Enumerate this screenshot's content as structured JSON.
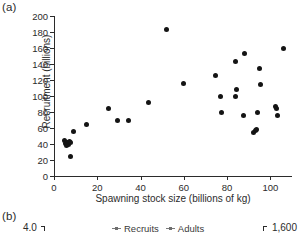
{
  "figure": {
    "panel_a_label": "(a)",
    "panel_b_label": "(b)"
  },
  "chart_data": {
    "type": "scatter",
    "title": "",
    "xlabel": "Spawning stock size (billions of kg)",
    "ylabel": "Recruitment (billions)",
    "xlim": [
      0,
      110
    ],
    "ylim": [
      0,
      200
    ],
    "xticks": [
      0,
      20,
      40,
      60,
      80,
      100
    ],
    "xtick_labels": [
      "0",
      "20",
      "40",
      "60",
      "80",
      "100"
    ],
    "yticks": [
      0,
      20,
      40,
      60,
      80,
      100,
      120,
      140,
      160,
      180,
      200
    ],
    "ytick_labels": [
      "0",
      "20",
      "40",
      "60",
      "80",
      "100",
      "120",
      "140",
      "160",
      "180",
      "200"
    ],
    "grid": false,
    "legend": null,
    "marker": "filled-circle",
    "marker_color": "#141414",
    "points": [
      {
        "x": 5.0,
        "y": 44
      },
      {
        "x": 5.5,
        "y": 41
      },
      {
        "x": 5.8,
        "y": 38
      },
      {
        "x": 6.3,
        "y": 42
      },
      {
        "x": 6.6,
        "y": 39
      },
      {
        "x": 7.2,
        "y": 43
      },
      {
        "x": 7.6,
        "y": 42
      },
      {
        "x": 7.8,
        "y": 24
      },
      {
        "x": 9.0,
        "y": 56
      },
      {
        "x": 15.0,
        "y": 65
      },
      {
        "x": 25.0,
        "y": 84
      },
      {
        "x": 29.5,
        "y": 70
      },
      {
        "x": 34.5,
        "y": 70
      },
      {
        "x": 43.5,
        "y": 92
      },
      {
        "x": 52.0,
        "y": 183
      },
      {
        "x": 60.0,
        "y": 116
      },
      {
        "x": 74.5,
        "y": 126
      },
      {
        "x": 77.0,
        "y": 99
      },
      {
        "x": 77.5,
        "y": 79
      },
      {
        "x": 84.0,
        "y": 143
      },
      {
        "x": 84.5,
        "y": 108
      },
      {
        "x": 84.0,
        "y": 99
      },
      {
        "x": 88.0,
        "y": 153
      },
      {
        "x": 87.5,
        "y": 76
      },
      {
        "x": 92.0,
        "y": 55
      },
      {
        "x": 93.0,
        "y": 57
      },
      {
        "x": 93.5,
        "y": 58
      },
      {
        "x": 94.0,
        "y": 80
      },
      {
        "x": 95.0,
        "y": 134
      },
      {
        "x": 95.5,
        "y": 115
      },
      {
        "x": 102.5,
        "y": 87
      },
      {
        "x": 102.8,
        "y": 84
      },
      {
        "x": 103.5,
        "y": 76
      },
      {
        "x": 106.0,
        "y": 159
      }
    ]
  },
  "panel_b": {
    "left_axis_top_value": "4.0",
    "right_axis_top_value": "1,600",
    "legend": [
      {
        "label": "Recruits"
      },
      {
        "label": "Adults"
      }
    ]
  }
}
